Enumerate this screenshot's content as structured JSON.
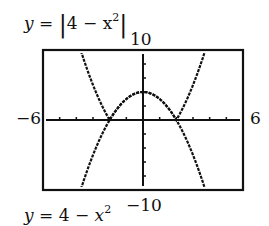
{
  "chart_data": {
    "type": "line",
    "title": "",
    "window": {
      "xmin": -6,
      "xmax": 6,
      "ymin": -10,
      "ymax": 10,
      "xscl": 1,
      "yscl": 2
    },
    "tick_labels": {
      "xmin": "−6",
      "xmax": "6",
      "ymax": "10",
      "ymin": "−10"
    },
    "series": [
      {
        "name": "y = |4 − x²|",
        "expr": "abs(4 - x^2)",
        "x": [
          -4.5,
          -4,
          -3,
          -2,
          -1,
          0,
          1,
          2,
          3,
          4,
          4.5
        ],
        "y": [
          16.25,
          12,
          5,
          0,
          3,
          4,
          3,
          0,
          5,
          12,
          16.25
        ]
      },
      {
        "name": "y = 4 − x²",
        "expr": "4 - x^2",
        "x": [
          -3.7,
          -3,
          -2,
          -1,
          0,
          1,
          2,
          3,
          3.7
        ],
        "y": [
          -9.69,
          -5,
          0,
          3,
          4,
          3,
          0,
          -5,
          -9.69
        ]
      }
    ],
    "grid": false,
    "annotations": [
      "y = |4 − x²|",
      "y = 4 − x²"
    ]
  },
  "labels": {
    "top_eq_prefix": "y = ",
    "top_eq_abs_body": "4 − x",
    "top_eq_exp": "2",
    "bottom_eq_y": "y",
    "bottom_eq_mid": " = 4 − ",
    "bottom_eq_x": "x",
    "bottom_eq_exp": "2",
    "ymax": "10",
    "ymin": "−10",
    "xmin": "−6",
    "xmax": "6"
  }
}
